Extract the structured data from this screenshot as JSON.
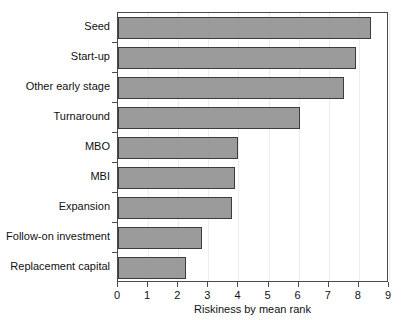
{
  "chart_data": {
    "type": "bar",
    "orientation": "horizontal",
    "title": "",
    "xlabel": "Riskiness by mean rank",
    "ylabel": "",
    "categories": [
      "Seed",
      "Start-up",
      "Other early stage",
      "Turnaround",
      "MBO",
      "MBI",
      "Expansion",
      "Follow-on investment",
      "Replacement capital"
    ],
    "values": [
      8.4,
      7.9,
      7.5,
      6.05,
      4.0,
      3.9,
      3.8,
      2.8,
      2.25
    ],
    "xlim": [
      0,
      9
    ],
    "xticks": [
      0,
      1,
      2,
      3,
      4,
      5,
      6,
      7,
      8,
      9
    ],
    "xticklabels": [
      "0",
      "1",
      "2",
      "3",
      "4",
      "5",
      "6",
      "7",
      "8",
      "9"
    ],
    "grid": true,
    "legend": null,
    "bar_color": "#9b9b9b",
    "bar_edge_color": "#3c3c3c",
    "axis_color": "#4a4a4a",
    "background": "#ffffff"
  }
}
